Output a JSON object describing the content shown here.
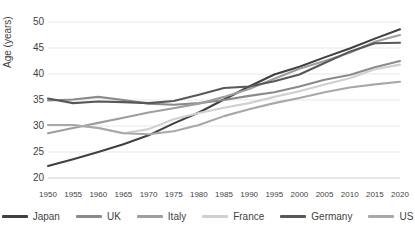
{
  "chart_data": {
    "type": "line",
    "title": "",
    "xlabel": "",
    "ylabel": "Age (years)",
    "ylim": [
      20,
      50
    ],
    "ytick_step": 5,
    "yticks": [
      50,
      45,
      40,
      35,
      30,
      25,
      20
    ],
    "grid": true,
    "legend_position": "bottom",
    "x": [
      1950,
      1955,
      1960,
      1965,
      1970,
      1975,
      1980,
      1985,
      1990,
      1995,
      2000,
      2005,
      2010,
      2015,
      2020
    ],
    "categories": [
      "1950",
      "1955",
      "1960",
      "1965",
      "1970",
      "1975",
      "1980",
      "1985",
      "1990",
      "1995",
      "2000",
      "2005",
      "2010",
      "2015",
      "2020"
    ],
    "series": [
      {
        "name": "Japan",
        "color": "#404040",
        "values": [
          22.3,
          23.6,
          25.0,
          26.5,
          28.2,
          30.5,
          32.6,
          35.1,
          37.6,
          39.9,
          41.4,
          43.2,
          44.9,
          46.8,
          48.6
        ]
      },
      {
        "name": "UK",
        "color": "#8a8a8a",
        "values": [
          34.9,
          35.1,
          35.6,
          35.0,
          34.3,
          34.1,
          34.4,
          35.0,
          35.8,
          36.5,
          37.6,
          38.9,
          39.8,
          41.3,
          42.5
        ]
      },
      {
        "name": "Italy",
        "color": "#9e9e9e",
        "values": [
          28.6,
          29.6,
          30.6,
          31.6,
          32.6,
          33.4,
          34.3,
          35.6,
          37.1,
          39.1,
          41.0,
          42.5,
          44.1,
          46.2,
          47.5
        ]
      },
      {
        "name": "France",
        "color": "#d0d0d0",
        "values": [
          30.2,
          30.2,
          29.6,
          28.6,
          29.4,
          31.3,
          32.5,
          33.5,
          34.4,
          35.6,
          36.7,
          38.0,
          39.2,
          40.9,
          41.8
        ]
      },
      {
        "name": "Germany",
        "color": "#585858",
        "values": [
          35.3,
          34.4,
          34.7,
          34.6,
          34.4,
          34.8,
          36.0,
          37.3,
          37.6,
          38.6,
          39.9,
          42.1,
          44.3,
          45.9,
          46.0
        ]
      },
      {
        "name": "US",
        "color": "#a8a8a8",
        "values": [
          30.2,
          30.2,
          29.6,
          28.6,
          28.4,
          29.0,
          30.2,
          31.9,
          33.2,
          34.4,
          35.4,
          36.5,
          37.4,
          38.0,
          38.5
        ]
      }
    ]
  },
  "axes": {
    "y_title": "Age (years)",
    "y_ticks": [
      "50",
      "45",
      "40",
      "35",
      "30",
      "25",
      "20"
    ],
    "x_ticks": [
      "1950",
      "1955",
      "1960",
      "1965",
      "1970",
      "1975",
      "1980",
      "1985",
      "1990",
      "1995",
      "2000",
      "2005",
      "2010",
      "2015",
      "2020"
    ]
  },
  "legend": {
    "items": [
      {
        "label": "Japan",
        "color": "#404040"
      },
      {
        "label": "UK",
        "color": "#8a8a8a"
      },
      {
        "label": "Italy",
        "color": "#9e9e9e"
      },
      {
        "label": "France",
        "color": "#d0d0d0"
      },
      {
        "label": "Germany",
        "color": "#585858"
      },
      {
        "label": "US",
        "color": "#a8a8a8"
      }
    ]
  }
}
